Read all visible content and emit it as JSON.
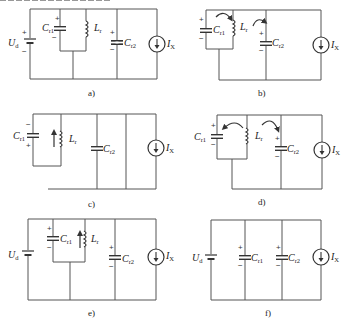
{
  "figure": {
    "header_text_clipped": true,
    "panels": [
      {
        "id": "a",
        "caption": "a)",
        "labels": {
          "source_voltage": "U",
          "source_voltage_sub": "d",
          "cap1": "C",
          "cap1_sub": "r1",
          "inductor": "L",
          "inductor_sub": "r",
          "cap2": "C",
          "cap2_sub": "r2",
          "current_source": "I",
          "current_source_sub": "X"
        }
      },
      {
        "id": "b",
        "caption": "b)",
        "labels": {
          "cap1": "C",
          "cap1_sub": "r1",
          "inductor": "L",
          "inductor_sub": "r",
          "cap2": "C",
          "cap2_sub": "r2",
          "current_source": "I",
          "current_source_sub": "X"
        }
      },
      {
        "id": "c",
        "caption": "c)",
        "labels": {
          "cap1": "C",
          "cap1_sub": "r1",
          "inductor": "L",
          "inductor_sub": "r",
          "cap2": "C",
          "cap2_sub": "r2",
          "current_source": "I",
          "current_source_sub": "X"
        }
      },
      {
        "id": "d",
        "caption": "d)",
        "labels": {
          "cap1": "C",
          "cap1_sub": "r1",
          "inductor": "L",
          "inductor_sub": "r",
          "cap2": "C",
          "cap2_sub": "r2",
          "current_source": "I",
          "current_source_sub": "X"
        }
      },
      {
        "id": "e",
        "caption": "e)",
        "labels": {
          "source_voltage": "U",
          "source_voltage_sub": "d",
          "cap1": "C",
          "cap1_sub": "r1",
          "inductor": "L",
          "inductor_sub": "r",
          "cap2": "C",
          "cap2_sub": "r2",
          "current_source": "I",
          "current_source_sub": "X"
        }
      },
      {
        "id": "f",
        "caption": "f)",
        "labels": {
          "source_voltage": "U",
          "source_voltage_sub": "d",
          "cap1": "C",
          "cap1_sub": "r1",
          "cap2": "C",
          "cap2_sub": "r2",
          "current_source": "I",
          "current_source_sub": "X"
        }
      }
    ],
    "signs": {
      "plus": "+",
      "minus": "−"
    }
  }
}
